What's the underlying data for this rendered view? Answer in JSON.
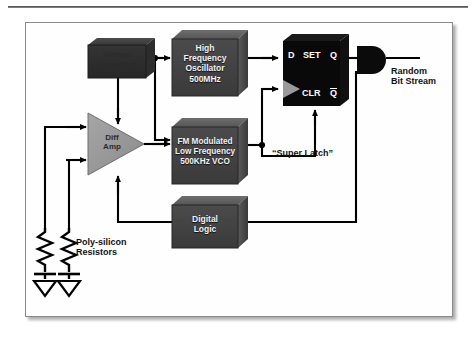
{
  "figure": {
    "background": "#ffffff",
    "frame_border": "#8a8a8a"
  },
  "colors": {
    "block_dark": "#3c3c3c",
    "block_mid": "#4f4f4f",
    "block_light_top": "#6b6b6b",
    "latch_black": "#090909",
    "amp_gray": "#9a9a9a",
    "wire": "#000000",
    "label_text": "#111111",
    "block_text": "#f2f2f2"
  },
  "blocks": [
    {
      "id": "voltage-regulator",
      "name": "voltage-regulator-block",
      "lines": [
        "Voltage",
        "Regulator"
      ],
      "style": "dark-low-contrast",
      "x": 88,
      "y": 38,
      "w": 58,
      "h": 40
    },
    {
      "id": "high-frequency-oscillator",
      "name": "high-frequency-oscillator-block",
      "lines": [
        "High",
        "Frequency",
        "Oscillator",
        "500MHz"
      ],
      "style": "dark",
      "x": 172,
      "y": 30,
      "w": 76,
      "h": 66
    },
    {
      "id": "fm-modulated-vco",
      "name": "fm-modulated-vco-block",
      "lines": [
        "FM Modulated",
        "Low Frequency",
        "500KHz VCO"
      ],
      "style": "dark",
      "x": 172,
      "y": 118,
      "w": 76,
      "h": 66
    },
    {
      "id": "digital-logic",
      "name": "digital-logic-block",
      "lines": [
        "Digital",
        "Logic"
      ],
      "style": "dark",
      "x": 172,
      "y": 196,
      "w": 76,
      "h": 52
    }
  ],
  "diff_amp": {
    "name": "diff-amp-triangle",
    "lines": [
      "Diff",
      "Amp"
    ],
    "x": 88,
    "y": 113,
    "w": 56,
    "h": 62
  },
  "latch": {
    "name": "super-latch-flipflop",
    "caption": "“Super Latch”",
    "pins": {
      "d": "D",
      "set": "SET",
      "q": "Q",
      "clr": "CLR",
      "qbar": "Q"
    },
    "qbar_overbar": true,
    "clock_marker": "clock-triangle",
    "x": 283,
    "y": 34,
    "w": 66,
    "h": 72
  },
  "output": {
    "buffer_name": "output-buffer-gate",
    "label_lines": [
      "Random",
      "Bit Stream"
    ],
    "label_x": 391,
    "label_y": 67
  },
  "resistors": {
    "name": "poly-silicon-resistors",
    "label_lines": [
      "Poly-silicon",
      "Resistors"
    ],
    "label_x": 74,
    "label_y": 238,
    "count": 2,
    "ground_symbol": "ground-triangle"
  },
  "signals": [
    {
      "from": "voltage-regulator",
      "to": "high-frequency-oscillator"
    },
    {
      "from": "voltage-regulator",
      "to": "fm-modulated-vco"
    },
    {
      "from": "voltage-regulator",
      "to": "diff-amp"
    },
    {
      "from": "high-frequency-oscillator",
      "to": "latch-d"
    },
    {
      "from": "fm-modulated-vco",
      "to": "latch-clock"
    },
    {
      "from": "fm-modulated-vco",
      "to": "latch-clr"
    },
    {
      "from": "diff-amp",
      "to": "fm-modulated-vco"
    },
    {
      "from": "latch-q",
      "to": "output-buffer"
    },
    {
      "from": "digital-logic",
      "to": "output-buffer"
    },
    {
      "from": "digital-logic",
      "to": "diff-amp"
    },
    {
      "from": "resistor-1",
      "to": "diff-amp-plus"
    },
    {
      "from": "resistor-2",
      "to": "diff-amp-minus"
    }
  ]
}
